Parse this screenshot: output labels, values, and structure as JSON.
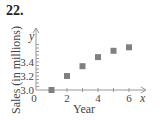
{
  "problem_number": "22.",
  "chart_data": {
    "type": "scatter",
    "title": "",
    "xlabel": "Year",
    "ylabel": "Sales (in millions)",
    "x_var": "x",
    "y_var": "y",
    "x": [
      1,
      2,
      3,
      4,
      5,
      6
    ],
    "values": [
      3.0,
      3.2,
      3.34,
      3.47,
      3.56,
      3.61
    ],
    "x_ticks": [
      "0",
      "2",
      "4",
      "6"
    ],
    "y_ticks": [
      "3.0",
      "3.2",
      "3.4"
    ],
    "xlim": [
      0,
      6.5
    ],
    "ylim": [
      3.0,
      3.7
    ],
    "grid": false,
    "marker": "square",
    "marker_color": "#808080",
    "axis_color": "#999999"
  }
}
